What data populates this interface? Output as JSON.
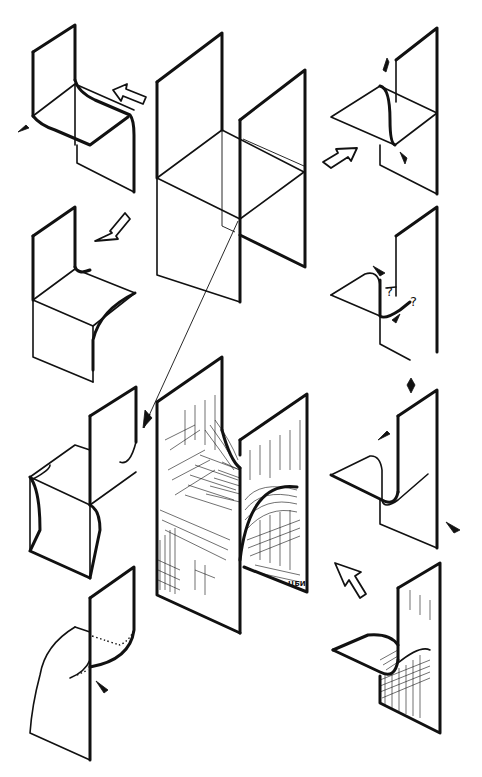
{
  "figure": {
    "colors": {
      "ink": "#111111",
      "paper": "#ffffff"
    },
    "panels": [
      {
        "id": "top-left",
        "label": "curved-fold-chair"
      },
      {
        "id": "center-top",
        "label": "intersecting-planes-grid"
      },
      {
        "id": "top-right",
        "label": "plane-with-s-fold"
      },
      {
        "id": "mid-left",
        "label": "chair-cube-fold"
      },
      {
        "id": "mid-right",
        "label": "s-fold-question"
      },
      {
        "id": "lower-left",
        "label": "cube-double-fold"
      },
      {
        "id": "center-bottom",
        "label": "shaded-saddle-surface"
      },
      {
        "id": "lower-right",
        "label": "plane-with-loop-fold"
      },
      {
        "id": "bottom-left",
        "label": "dotted-fold-plane"
      },
      {
        "id": "bottom-right",
        "label": "shaded-loop-fold"
      }
    ],
    "annotations": {
      "question_mark_1": "?",
      "question_mark_2": "?",
      "signature": "ЦБИ"
    },
    "arrows": [
      {
        "id": "arrow-top-left",
        "direction": "left"
      },
      {
        "id": "arrow-top-right",
        "direction": "up-right"
      },
      {
        "id": "arrow-mid-left",
        "direction": "down-left"
      },
      {
        "id": "arrow-bottom-right",
        "direction": "up-left"
      }
    ]
  }
}
